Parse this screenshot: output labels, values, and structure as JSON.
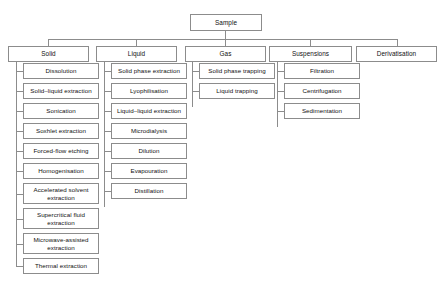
{
  "diagram": {
    "type": "tree-flowchart",
    "orientation": "top-down then vertical lists",
    "colors": {
      "background": "#ffffff",
      "box_border": "#8c8c8c",
      "connector": "#8c8c8c",
      "text": "#111111"
    },
    "root": {
      "label": "Sample"
    },
    "branches": [
      {
        "label": "Solid",
        "children": [
          "Dissolution",
          "Solid–liquid extraction",
          "Sonication",
          "Soxhlet extraction",
          "Forced-flow etching",
          "Homogenisation",
          "Accelerated solvent extraction",
          "Supercritical fluid extraction",
          "Microwave-assisted extraction",
          "Thermal extraction"
        ]
      },
      {
        "label": "Liquid",
        "children": [
          "Solid phase extraction",
          "Lyophilisation",
          "Liquid–liquid extraction",
          "Microdialysis",
          "Dilution",
          "Evapouration",
          "Distillation"
        ]
      },
      {
        "label": "Gas",
        "children": [
          "Solid phase trapping",
          "Liquid trapping"
        ]
      },
      {
        "label": "Suspensions",
        "children": [
          "Filtration",
          "Centrifugation",
          "Sedimentation"
        ]
      },
      {
        "label": "Derivatisation",
        "children": []
      }
    ]
  }
}
